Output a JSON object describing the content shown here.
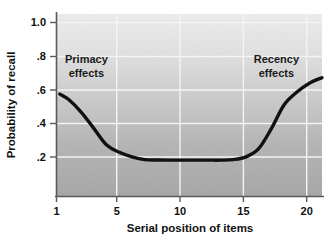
{
  "chart_data": {
    "type": "line",
    "title": "",
    "xlabel": "Serial position of items",
    "ylabel": "Probability of recall",
    "xlim": [
      1,
      22
    ],
    "ylim": [
      0,
      1.0
    ],
    "xticks": [
      1,
      5,
      10,
      15,
      20
    ],
    "xtick_labels": [
      "1",
      "5",
      "10",
      "15",
      "20"
    ],
    "yticks": [
      0.2,
      0.4,
      0.6,
      0.8,
      1.0
    ],
    "ytick_labels": [
      ".2",
      ".4",
      ".6",
      ".8",
      "1.0"
    ],
    "grid": "both",
    "legend": "none",
    "series": [
      {
        "name": "Probability of recall",
        "x": [
          1.3,
          2,
          3,
          4,
          5,
          6,
          7,
          8,
          9,
          10,
          11,
          12,
          13,
          14,
          15,
          16,
          17,
          18,
          19,
          20,
          21,
          22
        ],
        "values": [
          0.56,
          0.53,
          0.46,
          0.37,
          0.28,
          0.24,
          0.215,
          0.2,
          0.198,
          0.197,
          0.197,
          0.197,
          0.197,
          0.197,
          0.2,
          0.215,
          0.26,
          0.37,
          0.5,
          0.57,
          0.62,
          0.65
        ]
      }
    ],
    "annotations": [
      {
        "name": "primacy",
        "line1": "Primacy",
        "line2": "effects",
        "x": 3.4,
        "y": 0.73
      },
      {
        "name": "recency",
        "line1": "Recency",
        "line2": "effects",
        "x": 18.4,
        "y": 0.73
      }
    ],
    "colors": {
      "curve": "#111111",
      "axis": "#555555",
      "grid": "#f2f2f2",
      "plot_bg_top": "#e9e9e9",
      "plot_bg_bottom": "#a8a8a8",
      "page_bg": "#ffffff",
      "text": "#111111"
    }
  }
}
